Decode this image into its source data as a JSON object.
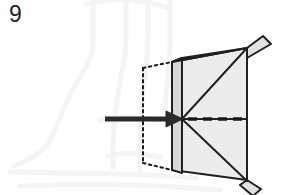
{
  "figure": {
    "number": "9",
    "type": "technical-isometric-diagram",
    "background_color": "#ffffff",
    "watermark": {
      "name": "chair-outline-watermark",
      "color": "#f4f4f4",
      "stroke_width": 5
    },
    "colors": {
      "outline": "#231f20",
      "face_light": "#ececec",
      "face_mid": "#e4e4e4",
      "face_dark": "#d8d8d8",
      "arrow": "#2b2b2b",
      "dashed_axis": "#1a1a1a",
      "hidden_outline": "#1a1a1a"
    },
    "geometry": {
      "apex": {
        "x": 182,
        "y": 119
      },
      "front_face_top_left": {
        "x": 172,
        "y": 62
      },
      "front_face_bottom_left": {
        "x": 172,
        "y": 170
      },
      "back_panel_x": 247,
      "top_tab_tip": {
        "x": 263,
        "y": 36
      },
      "bottom_tab_tip": {
        "x": 261,
        "y": 189
      }
    },
    "annotations": {
      "insertion_arrow": {
        "name": "insertion-direction-arrow",
        "start_x": 105,
        "end_x": 182,
        "y": 119,
        "thickness": 5,
        "head_length": 16,
        "head_half_width": 8
      },
      "center_axis": {
        "name": "center-axis-dashed-line",
        "start_x": 188,
        "end_x": 247,
        "y": 119,
        "dash": "9 6",
        "thickness": 3.5
      },
      "hidden_edges": {
        "name": "hidden-edge-dotted-outline",
        "left_x": 143,
        "right_x": 172,
        "top_y": 68,
        "bottom_y": 163,
        "dash": "2.5 3.5",
        "thickness": 2
      }
    }
  }
}
